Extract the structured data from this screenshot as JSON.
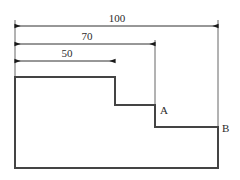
{
  "drawing": {
    "title": "stepped-profile-dimension-drawing",
    "background_color": "#ffffff",
    "outline_color": "#444444",
    "dimension_color": "#1a1a1a",
    "extension_color": "#555555",
    "outline_width": 2,
    "thin_width": 0.9,
    "dimensions": [
      {
        "id": "overall-width",
        "label": "100",
        "label_x": 117,
        "label_y": 22,
        "line_y": 26,
        "x_start": 15,
        "x_end": 218
      },
      {
        "id": "second-step-width",
        "label": "70",
        "label_x": 87,
        "label_y": 40,
        "line_y": 44,
        "x_start": 15,
        "x_end": 155
      },
      {
        "id": "first-step-width",
        "label": "50",
        "label_x": 67,
        "label_y": 57,
        "line_y": 61,
        "x_start": 15,
        "x_end": 115
      }
    ],
    "extension_lines": [
      {
        "id": "left-extension",
        "x": 15,
        "y_start": 20,
        "y_end": 77
      },
      {
        "id": "mid-extension",
        "x": 155,
        "y_start": 40,
        "y_end": 127
      },
      {
        "id": "right-extension",
        "x": 218,
        "y_start": 20,
        "y_end": 127
      }
    ],
    "profile": {
      "id": "stepped-outline",
      "points": "15,77 115,77 115,105 155,105 155,127 218,127 218,168 15,168",
      "closed": true
    },
    "point_labels": [
      {
        "id": "point-a",
        "label": "A",
        "x": 160,
        "y": 114
      },
      {
        "id": "point-b",
        "label": "B",
        "x": 222,
        "y": 132
      }
    ]
  }
}
